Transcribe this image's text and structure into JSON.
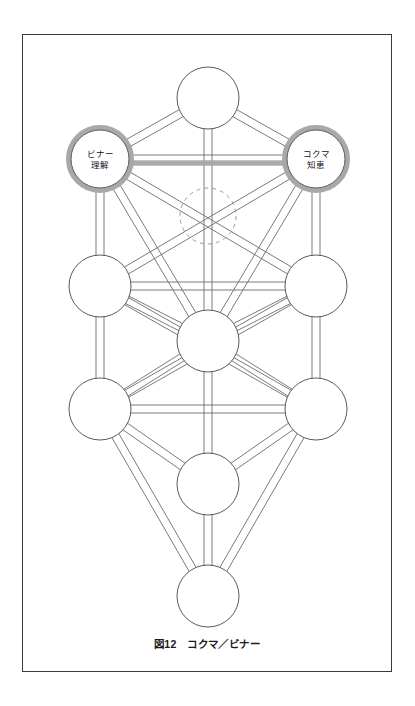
{
  "figure": {
    "caption": "図12　コクマ／ビナー",
    "frame_color": "#3a3a3a",
    "background": "#ffffff",
    "path_stroke": "#6b6b6b",
    "node_stroke": "#5a5a5a",
    "highlight_color": "#a8a8a8",
    "dashed_stroke": "#9a9a9a"
  },
  "diagram": {
    "type": "tree-of-life",
    "nodes": [
      {
        "id": "kether",
        "cx": 185,
        "cy": 63,
        "r": 31,
        "label_top": "",
        "label_bottom": "",
        "highlight": false
      },
      {
        "id": "binah",
        "cx": 77,
        "cy": 124,
        "r": 29,
        "label_top": "ビナー",
        "label_bottom": "理解",
        "highlight": true
      },
      {
        "id": "chokmah",
        "cx": 293,
        "cy": 124,
        "r": 29,
        "label_top": "コクマ",
        "label_bottom": "知恵",
        "highlight": true
      },
      {
        "id": "daat",
        "cx": 185,
        "cy": 181,
        "r": 28,
        "label_top": "",
        "label_bottom": "",
        "highlight": false,
        "dashed": true
      },
      {
        "id": "geburah",
        "cx": 77,
        "cy": 251,
        "r": 31,
        "label_top": "",
        "label_bottom": "",
        "highlight": false
      },
      {
        "id": "chesed",
        "cx": 293,
        "cy": 251,
        "r": 31,
        "label_top": "",
        "label_bottom": "",
        "highlight": false
      },
      {
        "id": "tiphareth",
        "cx": 185,
        "cy": 306,
        "r": 31,
        "label_top": "",
        "label_bottom": "",
        "highlight": false
      },
      {
        "id": "hod",
        "cx": 77,
        "cy": 374,
        "r": 31,
        "label_top": "",
        "label_bottom": "",
        "highlight": false
      },
      {
        "id": "netzach",
        "cx": 293,
        "cy": 374,
        "r": 31,
        "label_top": "",
        "label_bottom": "",
        "highlight": false
      },
      {
        "id": "yesod",
        "cx": 185,
        "cy": 449,
        "r": 31,
        "label_top": "",
        "label_bottom": "",
        "highlight": false
      },
      {
        "id": "malkuth",
        "cx": 185,
        "cy": 561,
        "r": 31,
        "label_top": "",
        "label_bottom": "",
        "highlight": false
      }
    ],
    "paths": [
      {
        "from": "kether",
        "to": "binah",
        "highlight": false
      },
      {
        "from": "kether",
        "to": "chokmah",
        "highlight": false
      },
      {
        "from": "kether",
        "to": "tiphareth",
        "highlight": false
      },
      {
        "from": "binah",
        "to": "chokmah",
        "highlight": true
      },
      {
        "from": "binah",
        "to": "geburah",
        "highlight": false
      },
      {
        "from": "binah",
        "to": "tiphareth",
        "highlight": false
      },
      {
        "from": "binah",
        "to": "chesed",
        "highlight": false
      },
      {
        "from": "chokmah",
        "to": "chesed",
        "highlight": false
      },
      {
        "from": "chokmah",
        "to": "tiphareth",
        "highlight": false
      },
      {
        "from": "chokmah",
        "to": "geburah",
        "highlight": false
      },
      {
        "from": "geburah",
        "to": "chesed",
        "highlight": false
      },
      {
        "from": "geburah",
        "to": "tiphareth",
        "highlight": false
      },
      {
        "from": "geburah",
        "to": "hod",
        "highlight": false
      },
      {
        "from": "chesed",
        "to": "tiphareth",
        "highlight": false
      },
      {
        "from": "chesed",
        "to": "netzach",
        "highlight": false
      },
      {
        "from": "geburah",
        "to": "netzach",
        "highlight": false
      },
      {
        "from": "chesed",
        "to": "hod",
        "highlight": false
      },
      {
        "from": "tiphareth",
        "to": "hod",
        "highlight": false
      },
      {
        "from": "tiphareth",
        "to": "netzach",
        "highlight": false
      },
      {
        "from": "tiphareth",
        "to": "yesod",
        "highlight": false
      },
      {
        "from": "hod",
        "to": "netzach",
        "highlight": false
      },
      {
        "from": "hod",
        "to": "yesod",
        "highlight": false
      },
      {
        "from": "netzach",
        "to": "yesod",
        "highlight": false
      },
      {
        "from": "hod",
        "to": "malkuth",
        "highlight": false
      },
      {
        "from": "netzach",
        "to": "malkuth",
        "highlight": false
      },
      {
        "from": "yesod",
        "to": "malkuth",
        "highlight": false
      }
    ]
  }
}
